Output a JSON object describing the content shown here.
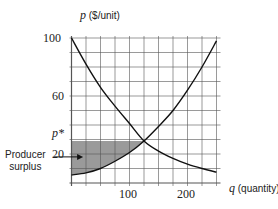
{
  "chart_data": {
    "type": "line",
    "title": "",
    "xlabel_var": "q",
    "xlabel_unit": "(quantity)",
    "ylabel_var": "p",
    "ylabel_unit": "($/unit)",
    "xlim": [
      0,
      250
    ],
    "ylim": [
      0,
      100
    ],
    "grid": true,
    "x_grid_step": 25,
    "y_grid_step": 10,
    "x_ticks": [
      100,
      200
    ],
    "x_tick_labels": [
      "100",
      "200"
    ],
    "y_ticks": [
      20,
      60,
      100
    ],
    "y_tick_labels": [
      "20",
      "60",
      "100"
    ],
    "series": [
      {
        "name": "Demand",
        "x": [
          0,
          25,
          50,
          75,
          100,
          125,
          150,
          175,
          200,
          225,
          250
        ],
        "y": [
          100,
          82,
          66,
          53,
          41,
          29,
          22,
          17,
          13,
          10,
          7.5
        ]
      },
      {
        "name": "Supply",
        "x": [
          0,
          25,
          50,
          75,
          100,
          125,
          150,
          175,
          200,
          225,
          250
        ],
        "y": [
          5.5,
          7,
          10,
          15,
          21,
          29,
          39,
          50,
          64,
          80,
          98
        ]
      }
    ],
    "equilibrium": {
      "q": 125,
      "p": 29,
      "label": "p*"
    },
    "shaded_region": {
      "name": "Producer surplus",
      "description": "Area between p* and supply curve from q=0 to q*",
      "color": "#9a9a9a"
    },
    "annotations": [
      {
        "text": "Producer surplus",
        "arrow_to": {
          "q": 20,
          "p": 18
        }
      },
      {
        "text": "p*",
        "at_p": 29
      }
    ]
  },
  "labels": {
    "y_axis": {
      "var": "p",
      "unit": "($/unit)"
    },
    "x_axis": {
      "var": "q",
      "unit": "(quantity)"
    },
    "y_ticks": {
      "t100": "100",
      "t60": "60",
      "t20": "20"
    },
    "x_ticks": {
      "t100": "100",
      "t200": "200"
    },
    "p_star": "p*",
    "annotation_line1": "Producer",
    "annotation_line2": "surplus"
  }
}
